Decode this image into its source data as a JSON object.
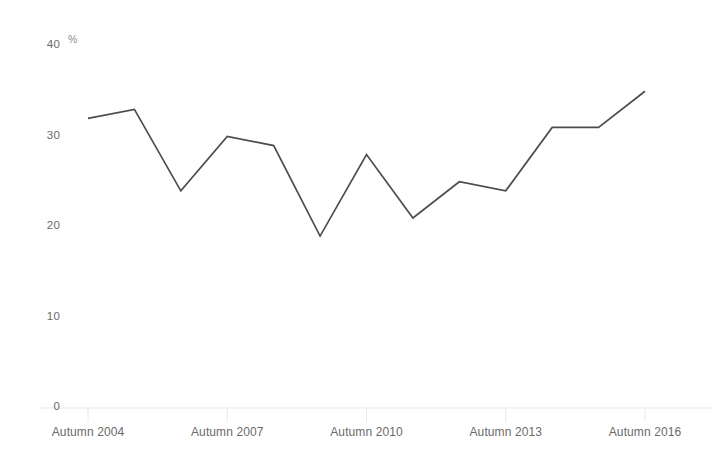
{
  "chart_data": {
    "type": "line",
    "title": "",
    "subtitle": "",
    "xlabel": "",
    "ylabel": "",
    "unit_label": "%",
    "categories": [
      "Autumn 2004",
      "Autumn 2005",
      "Autumn 2006",
      "Autumn 2007",
      "Autumn 2008",
      "Autumn 2009",
      "Autumn 2010",
      "Autumn 2011",
      "Autumn 2012",
      "Autumn 2013",
      "Autumn 2014",
      "Autumn 2015",
      "Autumn 2016"
    ],
    "values": [
      32,
      33,
      24,
      30,
      29,
      19,
      28,
      21,
      25,
      24,
      31,
      31,
      35
    ],
    "series": [
      {
        "name": "",
        "values": [
          32,
          33,
          24,
          30,
          29,
          19,
          28,
          21,
          25,
          24,
          31,
          31,
          35
        ]
      }
    ],
    "ylim": [
      0,
      40
    ],
    "yticks": [
      0,
      10,
      20,
      30,
      40
    ],
    "ytick_labels": [
      "0",
      "10",
      "20",
      "30",
      "40"
    ],
    "xtick_labels": [
      "Autumn 2004",
      "Autumn 2007",
      "Autumn 2010",
      "Autumn 2013",
      "Autumn 2016"
    ],
    "xtick_indices": [
      0,
      3,
      6,
      9,
      12
    ],
    "grid": false,
    "legend": "none",
    "line_color": "#4d4d4d",
    "axis_color": "#e8e8e8",
    "tick_label_color": "#6a6a6a",
    "background_color": "#ffffff"
  }
}
